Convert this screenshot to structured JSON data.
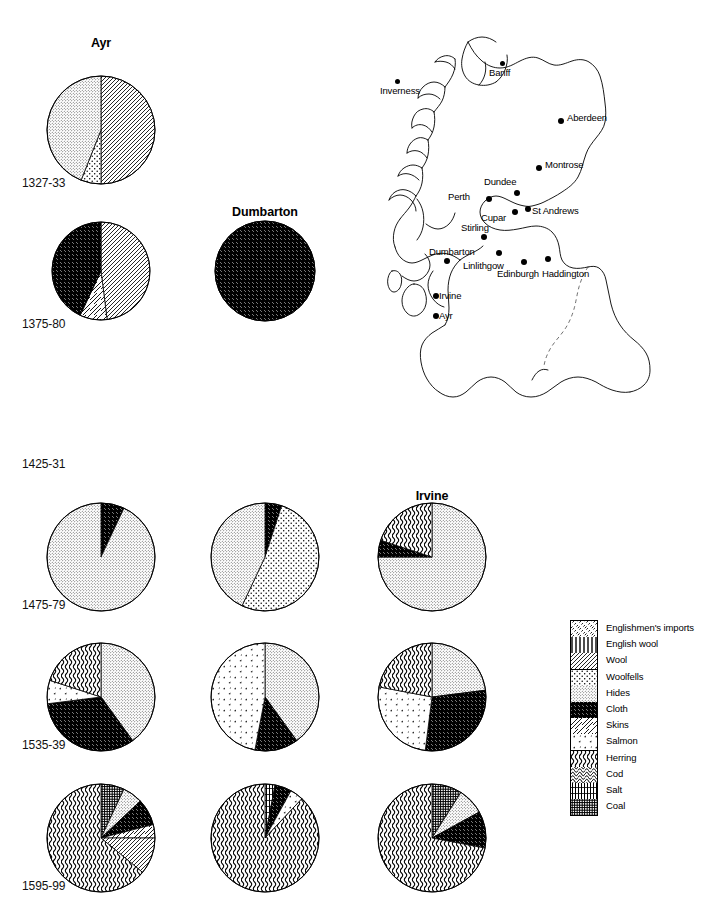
{
  "figure": {
    "burgh_titles": [
      {
        "name": "Ayr",
        "cx": 101,
        "y": 36
      },
      {
        "name": "Dumbarton",
        "cx": 265,
        "y": 205
      },
      {
        "name": "Irvine",
        "cx": 432,
        "y": 489
      }
    ],
    "period_labels": [
      {
        "text": "1327-33",
        "x": 22,
        "y": 176
      },
      {
        "text": "1375-80",
        "x": 22,
        "y": 317
      },
      {
        "text": "1425-31",
        "x": 22,
        "y": 457
      },
      {
        "text": "1475-79",
        "x": 22,
        "y": 598
      },
      {
        "text": "1535-39",
        "x": 22,
        "y": 738
      },
      {
        "text": "1595-99",
        "x": 22,
        "y": 879
      }
    ],
    "columns": [
      "Ayr",
      "Dumbarton",
      "Irvine"
    ]
  },
  "legend": {
    "title": "Commodities",
    "entries": [
      {
        "label": "Englishmen's imports",
        "pattern": "englishmens-imports"
      },
      {
        "label": "English wool",
        "pattern": "english-wool"
      },
      {
        "label": "Wool",
        "pattern": "wool"
      },
      {
        "label": "Woolfells",
        "pattern": "woolfells"
      },
      {
        "label": "Hides",
        "pattern": "hides"
      },
      {
        "label": "Cloth",
        "pattern": "cloth"
      },
      {
        "label": "Skins",
        "pattern": "skins"
      },
      {
        "label": "Salmon",
        "pattern": "salmon"
      },
      {
        "label": "Herring",
        "pattern": "herring"
      },
      {
        "label": "Cod",
        "pattern": "cod"
      },
      {
        "label": "Salt",
        "pattern": "salt"
      },
      {
        "label": "Coal",
        "pattern": "coal"
      }
    ]
  },
  "map": {
    "cities": [
      {
        "name": "Inverness",
        "dx": 23,
        "dy": 51,
        "lx": 8,
        "ly": 57,
        "anchor": "start",
        "big": false
      },
      {
        "name": "Banff",
        "dx": 128,
        "dy": 33,
        "lx": 117,
        "ly": 39,
        "anchor": "start",
        "big": false
      },
      {
        "name": "Aberdeen",
        "dx": 186,
        "dy": 90,
        "lx": 195,
        "ly": 84,
        "anchor": "start",
        "big": true
      },
      {
        "name": "Montrose",
        "dx": 164,
        "dy": 137,
        "lx": 173,
        "ly": 131,
        "anchor": "start",
        "big": true
      },
      {
        "name": "Dundee",
        "dx": 142,
        "dy": 162,
        "lx": 112,
        "ly": 148,
        "anchor": "start",
        "big": true
      },
      {
        "name": "Perth",
        "dx": 114,
        "dy": 168,
        "lx": 76,
        "ly": 163,
        "anchor": "start",
        "big": true
      },
      {
        "name": "Cupar",
        "dx": 140,
        "dy": 181,
        "lx": 109,
        "ly": 184,
        "anchor": "start",
        "big": true
      },
      {
        "name": "St Andrews",
        "dx": 153,
        "dy": 178,
        "lx": 160,
        "ly": 177,
        "anchor": "start",
        "big": true
      },
      {
        "name": "Stirling",
        "dx": 109,
        "dy": 206,
        "lx": 89,
        "ly": 194,
        "anchor": "start",
        "big": true
      },
      {
        "name": "Dumbarton",
        "dx": 72,
        "dy": 230,
        "lx": 57,
        "ly": 218,
        "anchor": "start",
        "big": true
      },
      {
        "name": "Linlithgow",
        "dx": 124,
        "dy": 222,
        "lx": 91,
        "ly": 232,
        "anchor": "start",
        "big": true
      },
      {
        "name": "Edinburgh",
        "dx": 149,
        "dy": 231,
        "lx": 125,
        "ly": 240,
        "anchor": "start",
        "big": true
      },
      {
        "name": "Haddington",
        "dx": 173,
        "dy": 228,
        "lx": 170,
        "ly": 240,
        "anchor": "start",
        "big": true
      },
      {
        "name": "Irvine",
        "dx": 61,
        "dy": 265,
        "lx": 67,
        "ly": 262,
        "anchor": "start",
        "big": true
      },
      {
        "name": "Ayr",
        "dx": 61,
        "dy": 285,
        "lx": 67,
        "ly": 282,
        "anchor": "start",
        "big": true
      }
    ]
  },
  "chart_data": {
    "type": "pie",
    "categories": [
      "Englishmen's imports",
      "English wool",
      "Wool",
      "Woolfells",
      "Hides",
      "Cloth",
      "Skins",
      "Salmon",
      "Herring",
      "Cod",
      "Salt",
      "Coal"
    ],
    "columns": [
      "Ayr",
      "Dumbarton",
      "Irvine"
    ],
    "periods": [
      "1327-33",
      "1375-80",
      "1425-31",
      "1475-79",
      "1535-39",
      "1595-99"
    ],
    "note": "Each pie shows the share (%) of each commodity. Empty cell = no pie drawn.",
    "pies": [
      {
        "period": "1327-33",
        "burgh": "Ayr",
        "cx": 101,
        "cy": 130,
        "r": 54,
        "slices": [
          {
            "category": "Wool",
            "pattern": "wool",
            "value": 50
          },
          {
            "category": "Woolfells",
            "pattern": "woolfells",
            "value": 6
          },
          {
            "category": "Hides",
            "pattern": "hides",
            "value": 44
          }
        ]
      },
      {
        "period": "1375-80",
        "burgh": "Ayr",
        "cx": 101,
        "cy": 271,
        "r": 49,
        "slices": [
          {
            "category": "Wool",
            "pattern": "wool",
            "value": 48
          },
          {
            "category": "Skins",
            "pattern": "skins",
            "value": 9
          },
          {
            "category": "Cloth",
            "pattern": "cloth",
            "value": 43
          }
        ]
      },
      {
        "period": "1375-80",
        "burgh": "Dumbarton",
        "cx": 265,
        "cy": 271,
        "r": 50,
        "slices": [
          {
            "category": "Cloth",
            "pattern": "cloth",
            "value": 100
          }
        ]
      },
      {
        "period": "1475-79",
        "burgh": "Ayr",
        "cx": 101,
        "cy": 557,
        "r": 54,
        "slices": [
          {
            "category": "Cloth",
            "pattern": "cloth",
            "value": 7
          },
          {
            "category": "Hides",
            "pattern": "hides",
            "value": 93
          }
        ]
      },
      {
        "period": "1475-79",
        "burgh": "Dumbarton",
        "cx": 265,
        "cy": 557,
        "r": 54,
        "slices": [
          {
            "category": "Cloth",
            "pattern": "cloth",
            "value": 5
          },
          {
            "category": "Woolfells",
            "pattern": "woolfells",
            "value": 52
          },
          {
            "category": "Hides",
            "pattern": "hides",
            "value": 43
          }
        ]
      },
      {
        "period": "1475-79",
        "burgh": "Irvine",
        "cx": 432,
        "cy": 557,
        "r": 54,
        "slices": [
          {
            "category": "Hides",
            "pattern": "hides",
            "value": 75
          },
          {
            "category": "Cloth",
            "pattern": "cloth",
            "value": 5
          },
          {
            "category": "Herring",
            "pattern": "herring",
            "value": 20
          }
        ]
      },
      {
        "period": "1535-39",
        "burgh": "Ayr",
        "cx": 101,
        "cy": 697,
        "r": 54,
        "slices": [
          {
            "category": "Hides",
            "pattern": "hides",
            "value": 40
          },
          {
            "category": "Cloth",
            "pattern": "cloth",
            "value": 33
          },
          {
            "category": "Salmon",
            "pattern": "salmon",
            "value": 7
          },
          {
            "category": "Herring",
            "pattern": "herring",
            "value": 20
          }
        ]
      },
      {
        "period": "1535-39",
        "burgh": "Dumbarton",
        "cx": 265,
        "cy": 697,
        "r": 54,
        "slices": [
          {
            "category": "Hides",
            "pattern": "hides",
            "value": 40
          },
          {
            "category": "Cloth",
            "pattern": "cloth",
            "value": 13
          },
          {
            "category": "Salmon",
            "pattern": "salmon",
            "value": 47
          }
        ]
      },
      {
        "period": "1535-39",
        "burgh": "Irvine",
        "cx": 432,
        "cy": 697,
        "r": 54,
        "slices": [
          {
            "category": "Hides",
            "pattern": "hides",
            "value": 23
          },
          {
            "category": "Cloth",
            "pattern": "cloth",
            "value": 29
          },
          {
            "category": "Salmon",
            "pattern": "salmon",
            "value": 26
          },
          {
            "category": "Herring",
            "pattern": "herring",
            "value": 22
          }
        ]
      },
      {
        "period": "1595-99",
        "burgh": "Ayr",
        "cx": 101,
        "cy": 838,
        "r": 54,
        "slices": [
          {
            "category": "Coal",
            "pattern": "coal",
            "value": 7
          },
          {
            "category": "Hides",
            "pattern": "hides",
            "value": 6
          },
          {
            "category": "Cloth",
            "pattern": "cloth",
            "value": 8
          },
          {
            "category": "Skins",
            "pattern": "skins",
            "value": 4
          },
          {
            "category": "Wool",
            "pattern": "wool",
            "value": 11
          },
          {
            "category": "Herring",
            "pattern": "herring",
            "value": 64
          }
        ]
      },
      {
        "period": "1595-99",
        "burgh": "Dumbarton",
        "cx": 265,
        "cy": 838,
        "r": 54,
        "slices": [
          {
            "category": "Salt",
            "pattern": "salt",
            "value": 3
          },
          {
            "category": "Cloth",
            "pattern": "cloth",
            "value": 5
          },
          {
            "category": "Salmon",
            "pattern": "salmon",
            "value": 4
          },
          {
            "category": "Herring",
            "pattern": "herring",
            "value": 88
          }
        ]
      },
      {
        "period": "1595-99",
        "burgh": "Irvine",
        "cx": 432,
        "cy": 838,
        "r": 54,
        "slices": [
          {
            "category": "Coal",
            "pattern": "coal",
            "value": 9
          },
          {
            "category": "Hides",
            "pattern": "hides",
            "value": 8
          },
          {
            "category": "Cloth",
            "pattern": "cloth",
            "value": 11
          },
          {
            "category": "Herring",
            "pattern": "herring",
            "value": 72
          }
        ]
      }
    ]
  }
}
